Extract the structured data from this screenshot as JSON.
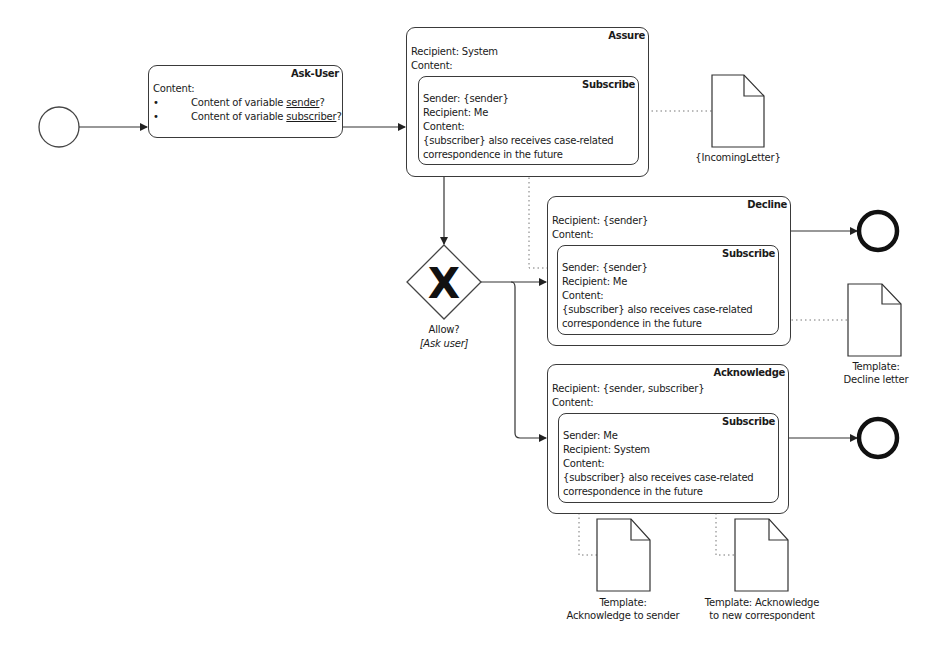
{
  "diagram": {
    "start_event": {
      "type": "start"
    },
    "ask_user": {
      "title": "Ask-User",
      "content_label": "Content:",
      "bullets": [
        {
          "prefix": "Content of variable ",
          "var": "sender",
          "suffix": "?"
        },
        {
          "prefix": "Content of variable ",
          "var": "subscriber",
          "suffix": "?"
        }
      ]
    },
    "assure": {
      "title": "Assure",
      "recipient": "Recipient: System",
      "content_label": "Content:",
      "inner": {
        "title": "Subscribe",
        "sender": "Sender: {sender}",
        "recipient": "Recipient: Me",
        "content_label": "Content:",
        "text_line1": "{subscriber} also receives case-related",
        "text_line2": "correspondence in the future"
      }
    },
    "incoming_letter": {
      "label": "{IncomingLetter}"
    },
    "gateway": {
      "symbol": "X",
      "label": "Allow?",
      "sublabel": "[Ask user]"
    },
    "decline": {
      "title": "Decline",
      "recipient": "Recipient: {sender}",
      "content_label": "Content:",
      "inner": {
        "title": "Subscribe",
        "sender": "Sender: {sender}",
        "recipient": "Recipient: Me",
        "content_label": "Content:",
        "text_line1": "{subscriber} also receives case-related",
        "text_line2": "correspondence in the future"
      }
    },
    "decline_letter": {
      "label_line1": "Template:",
      "label_line2": "Decline letter"
    },
    "acknowledge": {
      "title": "Acknowledge",
      "recipient": "Recipient: {sender, subscriber}",
      "content_label": "Content:",
      "inner": {
        "title": "Subscribe",
        "sender": "Sender: Me",
        "recipient": "Recipient: System",
        "content_label": "Content:",
        "text_line1": "{subscriber} also receives case-related",
        "text_line2": "correspondence in the future"
      }
    },
    "ack_sender_doc": {
      "label_line1": "Template:",
      "label_line2": "Acknowledge to sender"
    },
    "ack_new_doc": {
      "label_line1": "Template: Acknowledge",
      "label_line2": "to new correspondent"
    },
    "end_events": [
      {
        "type": "end"
      },
      {
        "type": "end"
      }
    ],
    "colors": {
      "stroke": "#3a3a3a",
      "text": "#1a1a1a",
      "background": "#ffffff"
    }
  }
}
